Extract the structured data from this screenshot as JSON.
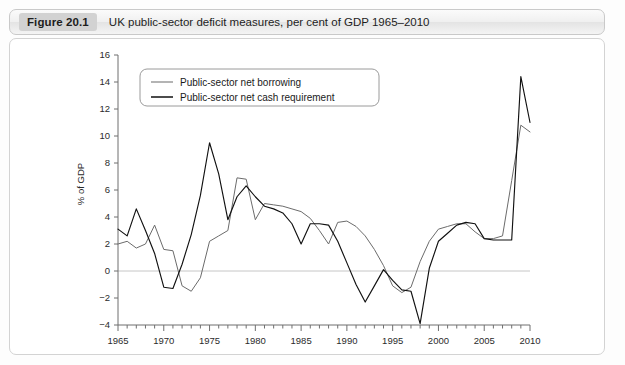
{
  "caption": {
    "figure_tag": "Figure 20.1",
    "title": "UK public-sector deficit measures, per cent of GDP 1965–2010"
  },
  "chart_data": {
    "type": "line",
    "title": "UK public-sector deficit measures, per cent of GDP 1965–2010",
    "xlabel": "",
    "ylabel": "% of GDP",
    "xlim": [
      1965,
      2010
    ],
    "ylim": [
      -4,
      16
    ],
    "ytick_labels": [
      "16",
      "14",
      "12",
      "10",
      "8",
      "6",
      "4",
      "2",
      "0",
      "−2",
      "−4"
    ],
    "yticks": [
      16,
      14,
      12,
      10,
      8,
      6,
      4,
      2,
      0,
      -2,
      -4
    ],
    "xtick_labels": [
      "1965",
      "1970",
      "1975",
      "1980",
      "1985",
      "1990",
      "1995",
      "2000",
      "2005",
      "2010"
    ],
    "xticks": [
      1965,
      1970,
      1975,
      1980,
      1985,
      1990,
      1995,
      2000,
      2005,
      2010
    ],
    "minor_xtick_interval": 1,
    "grid": false,
    "zero_line": true,
    "legend_position": "top-left",
    "x": [
      1965,
      1966,
      1967,
      1968,
      1969,
      1970,
      1971,
      1972,
      1973,
      1974,
      1975,
      1976,
      1977,
      1978,
      1979,
      1980,
      1981,
      1982,
      1983,
      1984,
      1985,
      1986,
      1987,
      1988,
      1989,
      1990,
      1991,
      1992,
      1993,
      1994,
      1995,
      1996,
      1997,
      1998,
      1999,
      2000,
      2001,
      2002,
      2003,
      2004,
      2005,
      2006,
      2007,
      2008,
      2009,
      2010
    ],
    "series": [
      {
        "name": "Public-sector net borrowing",
        "color": "#6b6b6b",
        "values": [
          2.0,
          2.2,
          1.7,
          2.0,
          3.4,
          1.6,
          1.5,
          -1.1,
          -1.5,
          -0.5,
          2.2,
          2.6,
          3.0,
          6.9,
          6.8,
          3.8,
          5.0,
          4.9,
          4.8,
          4.6,
          4.4,
          3.9,
          3.0,
          2.0,
          3.6,
          3.7,
          3.3,
          2.6,
          1.6,
          0.4,
          -1.1,
          -1.6,
          -1.2,
          0.7,
          2.2,
          3.1,
          3.3,
          3.5,
          3.5,
          2.9,
          2.4,
          2.4,
          2.6,
          6.7,
          10.8,
          10.3
        ]
      },
      {
        "name": "Public-sector net cash requirement",
        "color": "#111111",
        "values": [
          3.1,
          2.6,
          4.6,
          3.0,
          1.3,
          -1.2,
          -1.3,
          0.5,
          2.7,
          5.6,
          9.5,
          7.2,
          3.8,
          5.5,
          6.3,
          5.5,
          4.8,
          4.6,
          4.3,
          3.5,
          2.0,
          3.5,
          3.5,
          3.4,
          2.2,
          0.6,
          -1.0,
          -2.3,
          -1.1,
          0.1,
          -0.7,
          -1.4,
          -1.5,
          -3.9,
          0.2,
          2.2,
          2.8,
          3.4,
          3.6,
          3.5,
          2.4,
          2.3,
          2.3,
          2.3,
          14.4,
          11.0
        ]
      }
    ]
  },
  "legend": {
    "items": [
      {
        "label": "Public-sector net borrowing",
        "key": "psnb"
      },
      {
        "label": "Public-sector net cash requirement",
        "key": "ncr"
      }
    ]
  },
  "colors": {
    "psnb": "#6b6b6b",
    "ncr": "#111111",
    "axis": "#6f6f6f",
    "zero_line": "#c6c6c6",
    "caption_tag_bg": "#d2d2d2",
    "panel_border": "#d3d3d3"
  }
}
